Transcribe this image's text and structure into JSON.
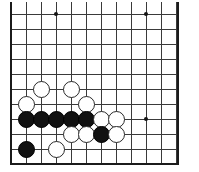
{
  "figure": {
    "kind": "go-board-diagram",
    "board_background": "#ffffff",
    "line_color": "#3a3a3a",
    "edge_color": "#1b1b1b",
    "black_stone_color": "#111111",
    "white_stone_color": "#ffffff",
    "white_stone_border": "#2a2a2a"
  },
  "board": {
    "origin_x": 11,
    "origin_y": 14,
    "spacing": 15,
    "left_edge_x": 11,
    "right_edge_x": 177,
    "top_edge_y": 0,
    "bottom_edge_y": 163,
    "columns": 12,
    "rows": 10,
    "vertical_lines_x": [
      11,
      26,
      41,
      56,
      71,
      86,
      101,
      116,
      131,
      146,
      161,
      176
    ],
    "horizontal_lines_y": [
      14,
      29,
      44,
      59,
      74,
      89,
      104,
      119,
      134,
      149
    ],
    "top_partial_line_y": 2,
    "bottom_frame_y": 163
  },
  "star_points": [
    {
      "name": "star-point-upper-left",
      "x": 56,
      "y": 14
    },
    {
      "name": "star-point-upper-right",
      "x": 146,
      "y": 14
    },
    {
      "name": "star-point-right",
      "x": 146,
      "y": 119
    }
  ],
  "stones": [
    {
      "color": "white",
      "x": 41,
      "y": 89,
      "label": "white-stone-1"
    },
    {
      "color": "white",
      "x": 71,
      "y": 89,
      "label": "white-stone-2"
    },
    {
      "color": "white",
      "x": 26,
      "y": 104,
      "label": "white-stone-3"
    },
    {
      "color": "white",
      "x": 86,
      "y": 104,
      "label": "white-stone-4"
    },
    {
      "color": "black",
      "x": 26,
      "y": 119,
      "label": "black-stone-1"
    },
    {
      "color": "black",
      "x": 41,
      "y": 119,
      "label": "black-stone-2"
    },
    {
      "color": "black",
      "x": 56,
      "y": 119,
      "label": "black-stone-3"
    },
    {
      "color": "black",
      "x": 71,
      "y": 119,
      "label": "black-stone-4"
    },
    {
      "color": "black",
      "x": 86,
      "y": 119,
      "label": "black-stone-5"
    },
    {
      "color": "white",
      "x": 101,
      "y": 119,
      "label": "white-stone-5"
    },
    {
      "color": "white",
      "x": 116,
      "y": 119,
      "label": "white-stone-6"
    },
    {
      "color": "white",
      "x": 71,
      "y": 134,
      "label": "white-stone-7"
    },
    {
      "color": "white",
      "x": 86,
      "y": 134,
      "label": "white-stone-8"
    },
    {
      "color": "black",
      "x": 101,
      "y": 134,
      "label": "black-stone-6"
    },
    {
      "color": "white",
      "x": 116,
      "y": 134,
      "label": "white-stone-9"
    },
    {
      "color": "black",
      "x": 26,
      "y": 149,
      "label": "black-stone-7"
    },
    {
      "color": "white",
      "x": 56,
      "y": 149,
      "label": "white-stone-10"
    }
  ]
}
